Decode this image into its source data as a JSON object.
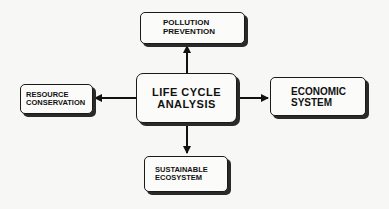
{
  "diagram": {
    "center": {
      "line1": "LIFE CYCLE",
      "line2": "ANALYSIS"
    },
    "top": {
      "line1": "POLLUTION",
      "line2": "PREVENTION"
    },
    "left": {
      "line1": "RESOURCE",
      "line2": "CONSERVATION"
    },
    "right": {
      "line1": "ECONOMIC",
      "line2": "SYSTEM"
    },
    "bottom": {
      "line1": "SUSTAINABLE",
      "line2": "ECOSYSTEM"
    },
    "edges": [
      {
        "from": "center",
        "to": "top"
      },
      {
        "from": "center",
        "to": "left"
      },
      {
        "from": "center",
        "to": "right"
      },
      {
        "from": "center",
        "to": "bottom"
      }
    ]
  }
}
